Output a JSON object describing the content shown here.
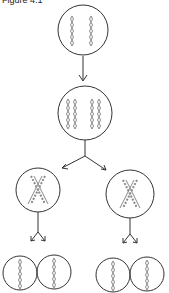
{
  "caption": "Figure 4.1",
  "diagram": {
    "stroke_color": "#333333",
    "chromosome_color": "#8a8a8a",
    "stages": [
      {
        "name": "parent-cell",
        "label": "Parent cell with 2 chromosomes",
        "cx": 83,
        "cy": 30,
        "r": 25
      },
      {
        "name": "replicated-cell",
        "label": "Cell with replicated chromosomes",
        "cx": 85,
        "cy": 113,
        "r": 27
      },
      {
        "name": "meiosis-1-left",
        "label": "Daughter cell (crossover)",
        "cx": 38,
        "cy": 190,
        "r": 22
      },
      {
        "name": "meiosis-1-right",
        "label": "Daughter cell (crossover)",
        "cx": 130,
        "cy": 194,
        "r": 24
      },
      {
        "name": "gamete-1",
        "label": "Gamete",
        "cx": 20,
        "cy": 273,
        "r": 17
      },
      {
        "name": "gamete-2",
        "label": "Gamete",
        "cx": 54,
        "cy": 272,
        "r": 17
      },
      {
        "name": "gamete-3",
        "label": "Gamete",
        "cx": 113,
        "cy": 275,
        "r": 17
      },
      {
        "name": "gamete-4",
        "label": "Gamete",
        "cx": 147,
        "cy": 274,
        "r": 17
      }
    ]
  }
}
